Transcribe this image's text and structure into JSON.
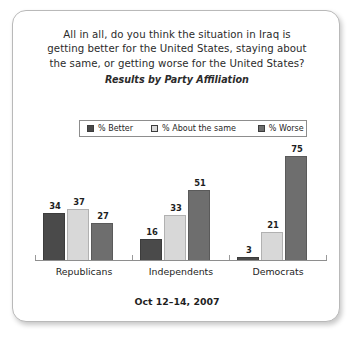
{
  "card": {
    "title_lines": [
      "All in all, do you think the situation in Iraq is",
      "getting better for the United States, staying about",
      "the same, or getting worse for the United States?"
    ],
    "subtitle": "Results by Party Affiliation",
    "footer_date": "Oct 12–14, 2007"
  },
  "chart_data": {
    "type": "bar",
    "title": "All in all, do you think the situation in Iraq is getting better for the United States, staying about the same, or getting worse for the United States?",
    "subtitle": "Results by Party Affiliation",
    "categories": [
      "Republicans",
      "Independents",
      "Democrats"
    ],
    "series": [
      {
        "name": "% Better",
        "color": "#4a4a4a",
        "values": [
          34,
          37,
          3
        ]
      },
      {
        "name": "% About the same",
        "color": "#d8d8d8",
        "values": [
          37,
          33,
          21
        ]
      },
      {
        "name": "% Worse",
        "color": "#6e6e6e",
        "values": [
          27,
          51,
          75
        ]
      }
    ],
    "series_values_by_category": {
      "Republicans": {
        "% Better": 34,
        "% About the same": 37,
        "% Worse": 27
      },
      "Independents": {
        "% Better": 16,
        "% About the same": 33,
        "% Worse": 51
      },
      "Democrats": {
        "% Better": 3,
        "% About the same": 21,
        "% Worse": 75
      }
    },
    "bars": [
      {
        "group": "Republicans",
        "series": "% Better",
        "value": 34
      },
      {
        "group": "Republicans",
        "series": "% About the same",
        "value": 37
      },
      {
        "group": "Republicans",
        "series": "% Worse",
        "value": 27
      },
      {
        "group": "Independents",
        "series": "% Better",
        "value": 16
      },
      {
        "group": "Independents",
        "series": "% About the same",
        "value": 33
      },
      {
        "group": "Independents",
        "series": "% Worse",
        "value": 51
      },
      {
        "group": "Democrats",
        "series": "% Better",
        "value": 3
      },
      {
        "group": "Democrats",
        "series": "% About the same",
        "value": 21
      },
      {
        "group": "Democrats",
        "series": "% Worse",
        "value": 75
      }
    ],
    "xlabel": "",
    "ylabel": "",
    "ylim": [
      0,
      80
    ],
    "grid": false,
    "data_labels": true,
    "legend_position": "top",
    "legend": [
      "% Better",
      "% About the same",
      "% Worse"
    ],
    "note": "Oct 12–14, 2007"
  }
}
